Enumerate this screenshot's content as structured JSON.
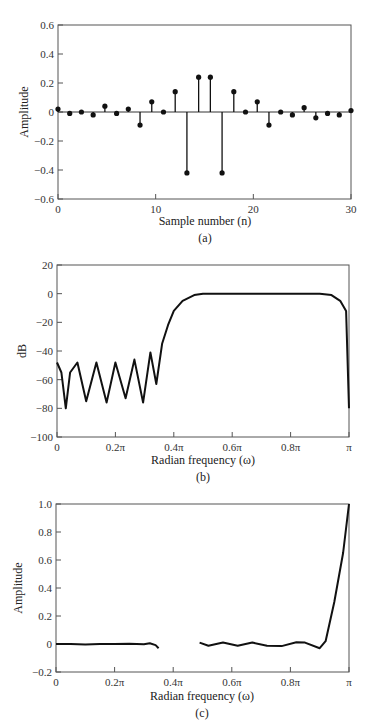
{
  "chart_data": [
    {
      "id": "a",
      "type": "stem",
      "caption": "(a)",
      "xlabel": "Sample number (n)",
      "ylabel": "Amplitude",
      "xlim": [
        0,
        30
      ],
      "ylim": [
        -0.6,
        0.6
      ],
      "xticks": [
        0,
        10,
        20,
        30
      ],
      "xtick_labels": [
        "0",
        "10",
        "20",
        "30"
      ],
      "yticks": [
        0.6,
        0.4,
        0.2,
        0,
        -0.2,
        -0.4,
        -0.6
      ],
      "ytick_labels": [
        "0.6",
        "0.4",
        "0.2",
        "0",
        "−0.2",
        "−0.4",
        "−0.6"
      ],
      "grid": false,
      "x": [
        0,
        1.2,
        2.4,
        3.6,
        4.8,
        6.0,
        7.2,
        8.4,
        9.6,
        10.8,
        12.0,
        13.2,
        14.4,
        15.6,
        16.8,
        18.0,
        19.2,
        20.4,
        21.6,
        22.8,
        24.0,
        25.2,
        26.4,
        27.6,
        28.8,
        30.0
      ],
      "values": [
        0.02,
        -0.01,
        0.0,
        -0.02,
        0.04,
        -0.01,
        0.02,
        -0.09,
        0.07,
        0.0,
        0.14,
        -0.42,
        0.24,
        0.24,
        -0.42,
        0.14,
        0.0,
        0.07,
        -0.09,
        0.0,
        -0.02,
        0.03,
        -0.04,
        -0.01,
        -0.02,
        0.01
      ]
    },
    {
      "id": "b",
      "type": "line",
      "caption": "(b)",
      "xlabel": "Radian frequency (ω)",
      "ylabel": "dB",
      "xlim": [
        0,
        1
      ],
      "ylim": [
        -100,
        20
      ],
      "xticks": [
        0,
        0.2,
        0.4,
        0.6,
        0.8,
        1.0
      ],
      "xtick_labels": [
        "0",
        "0.2π",
        "0.4π",
        "0.6π",
        "0.8π",
        "π"
      ],
      "yticks": [
        20,
        0,
        -20,
        -40,
        -60,
        -80,
        -100
      ],
      "ytick_labels": [
        "20",
        "0",
        "−20",
        "−40",
        "−60",
        "−80",
        "−100"
      ],
      "grid": false,
      "series": [
        {
          "name": "magnitude response",
          "x": [
            0,
            0.015,
            0.03,
            0.045,
            0.07,
            0.1,
            0.135,
            0.17,
            0.2,
            0.235,
            0.265,
            0.295,
            0.32,
            0.34,
            0.36,
            0.38,
            0.4,
            0.43,
            0.47,
            0.5,
            0.6,
            0.7,
            0.8,
            0.9,
            0.94,
            0.97,
            0.99,
            1.0
          ],
          "values": [
            -48,
            -55,
            -80,
            -55,
            -48,
            -75,
            -48,
            -76,
            -48,
            -73,
            -46,
            -76,
            -41,
            -63,
            -35,
            -22,
            -12,
            -5,
            -1,
            0,
            0,
            0,
            0,
            0,
            -1,
            -5,
            -12,
            -80
          ]
        }
      ]
    },
    {
      "id": "c",
      "type": "line",
      "caption": "(c)",
      "xlabel": "Radian frequency (ω)",
      "ylabel": "Amplitude",
      "xlim": [
        0,
        1
      ],
      "ylim": [
        -0.2,
        1.0
      ],
      "xticks": [
        0,
        0.2,
        0.4,
        0.6,
        0.8,
        1.0
      ],
      "xtick_labels": [
        "0",
        "0.2π",
        "0.4π",
        "0.6π",
        "0.8π",
        "π"
      ],
      "yticks": [
        1.0,
        0.8,
        0.6,
        0.4,
        0.2,
        0,
        -0.2
      ],
      "ytick_labels": [
        "1.0",
        "0.8",
        "0.6",
        "0.4",
        "0.2",
        "0",
        "−0.2"
      ],
      "grid": false,
      "series": [
        {
          "name": "stopband segment",
          "x": [
            0,
            0.05,
            0.1,
            0.15,
            0.2,
            0.25,
            0.3,
            0.32,
            0.34,
            0.35
          ],
          "values": [
            0,
            0.0,
            -0.003,
            0.0,
            0.0,
            0.002,
            -0.002,
            0.006,
            -0.008,
            -0.03
          ]
        },
        {
          "name": "passband segment",
          "x": [
            0.49,
            0.52,
            0.57,
            0.62,
            0.67,
            0.72,
            0.77,
            0.82,
            0.85,
            0.9,
            0.92,
            0.95,
            0.98,
            1.0
          ],
          "values": [
            0.01,
            -0.012,
            0.01,
            -0.012,
            0.01,
            -0.012,
            -0.015,
            0.012,
            0.01,
            -0.03,
            0.02,
            0.3,
            0.65,
            1.0
          ]
        }
      ]
    }
  ],
  "panels": {
    "a": {
      "caption": "(a)",
      "xlabel": "Sample number (n)",
      "ylabel": "Amplitude"
    },
    "b": {
      "caption": "(b)",
      "xlabel": "Radian frequency (ω)",
      "ylabel": "dB"
    },
    "c": {
      "caption": "(c)",
      "xlabel": "Radian frequency (ω)",
      "ylabel": "Amplitude"
    }
  }
}
